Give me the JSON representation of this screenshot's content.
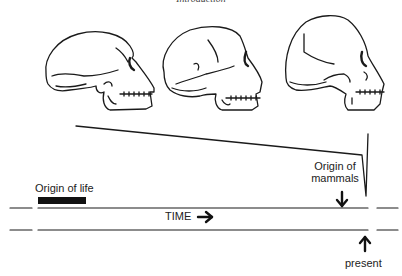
{
  "header": {
    "title": "Introduction"
  },
  "skulls": [
    {
      "id": "skull-early-hominin",
      "position": "left"
    },
    {
      "id": "skull-archaic-human",
      "position": "middle"
    },
    {
      "id": "skull-modern-human",
      "position": "right"
    }
  ],
  "timeline": {
    "axis_label": "TIME",
    "axis_arrow": "arrow-right",
    "origin_of_life_label": "Origin of life",
    "origin_of_mammals_label_line1": "Origin of",
    "origin_of_mammals_label_line2": "mammals",
    "present_label": "present"
  },
  "colors": {
    "ink": "#1a1a1a",
    "background": "#ffffff"
  }
}
